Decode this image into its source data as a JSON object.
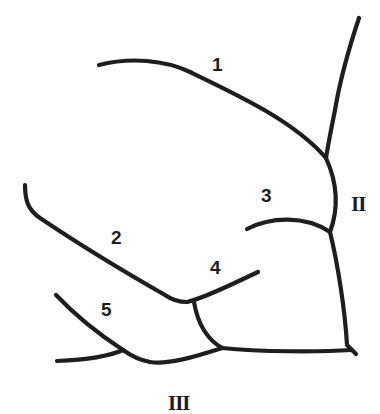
{
  "diagram": {
    "type": "branching-line-drawing",
    "stroke_color": "#1e1e1e",
    "background": "#ffffff",
    "branch_labels": [
      {
        "id": "1",
        "text": "1"
      },
      {
        "id": "2",
        "text": "2"
      },
      {
        "id": "3",
        "text": "3"
      },
      {
        "id": "4",
        "text": "4"
      },
      {
        "id": "5",
        "text": "5"
      }
    ],
    "trunk_labels": [
      {
        "id": "II",
        "text": "II"
      },
      {
        "id": "III",
        "text": "III"
      }
    ]
  }
}
